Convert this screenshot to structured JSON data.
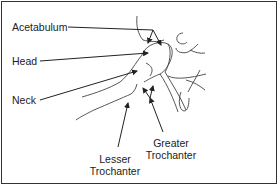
{
  "diagram": {
    "labels": {
      "acetabulum": "Acetabulum",
      "head": "Head",
      "neck": "Neck",
      "lesser_trochanter_line1": "Lesser",
      "lesser_trochanter_line2": "Trochanter",
      "greater_trochanter_line1": "Greater",
      "greater_trochanter_line2": "Trochanter"
    },
    "colors": {
      "line": "#222222",
      "bone_outline": "#444444",
      "border": "#333333",
      "background": "#ffffff"
    }
  }
}
